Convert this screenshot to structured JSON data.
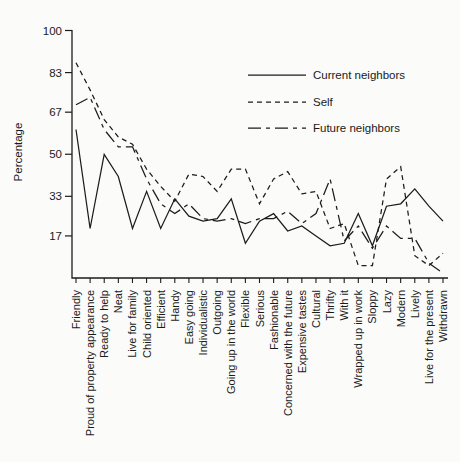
{
  "figure": {
    "background": "#fbfbf9",
    "ink_color": "#1c1c1c",
    "ylabel": "Percentage"
  },
  "chart_data": {
    "type": "line",
    "title": "",
    "xlabel": "",
    "ylabel": "Percentage",
    "ylim": [
      0,
      100
    ],
    "y_ticks": [
      17,
      33,
      50,
      67,
      83,
      100
    ],
    "grid": false,
    "legend_position": "upper right",
    "categories": [
      "Friendly",
      "Proud of property appearance",
      "Ready to help",
      "Neat",
      "Live for family",
      "Child oriented",
      "Efficient",
      "Handy",
      "Easy going",
      "Individualistic",
      "Outgoing",
      "Going up in the world",
      "Flexible",
      "Serious",
      "Fashionable",
      "Concerned with the future",
      "Expensive tastes",
      "Cultural",
      "Thrifty",
      "With it",
      "Wrapped up in work",
      "Sloppy",
      "Lazy",
      "Modern",
      "Lively",
      "Live for the present",
      "Withdrawn"
    ],
    "series": [
      {
        "name": "Current neighbors",
        "line_style": "solid",
        "values": [
          60,
          20,
          50,
          41,
          20,
          35,
          20,
          32,
          25,
          23,
          24,
          32,
          14,
          23,
          26,
          19,
          21,
          17,
          13,
          14,
          26,
          13,
          29,
          30,
          36,
          29,
          23
        ]
      },
      {
        "name": "Self",
        "line_style": "dashed",
        "values": [
          87,
          76,
          64,
          57,
          54,
          44,
          37,
          31,
          42,
          41,
          35,
          44,
          44,
          30,
          40,
          43,
          34,
          35,
          20,
          22,
          5,
          5,
          40,
          45,
          9,
          5,
          10
        ]
      },
      {
        "name": "Future neighbors",
        "line_style": "dash-dot",
        "values": [
          70,
          73,
          60,
          53,
          53,
          40,
          30,
          26,
          30,
          24,
          23,
          24,
          22,
          24,
          24,
          27,
          22,
          26,
          40,
          15,
          21,
          12,
          21,
          16,
          16,
          6,
          2
        ]
      }
    ]
  }
}
